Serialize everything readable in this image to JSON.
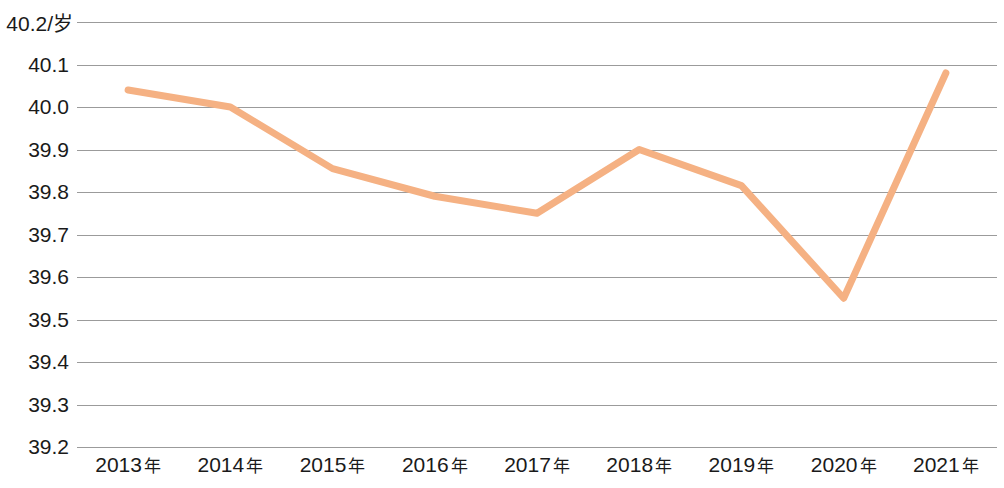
{
  "chart_data": {
    "type": "line",
    "title": "",
    "subtitle": "",
    "xlabel": "",
    "ylabel": "",
    "unit_label": "40.2/岁",
    "unit": "岁",
    "categories": [
      "2013年",
      "2014年",
      "2015年",
      "2016年",
      "2017年",
      "2018年",
      "2019年",
      "2020年",
      "2021年"
    ],
    "x": [
      2013,
      2014,
      2015,
      2016,
      2017,
      2018,
      2019,
      2020,
      2021
    ],
    "values": [
      40.04,
      40.0,
      39.855,
      39.79,
      39.75,
      39.9,
      39.815,
      39.55,
      40.08
    ],
    "series": [
      {
        "name": "",
        "values": [
          40.04,
          40.0,
          39.855,
          39.79,
          39.75,
          39.9,
          39.815,
          39.55,
          40.08
        ]
      }
    ],
    "ylim": [
      39.2,
      40.2
    ],
    "ytick_labels": [
      "40.2/岁",
      "40.1",
      "40.0",
      "39.9",
      "39.8",
      "39.7",
      "39.6",
      "39.5",
      "39.4",
      "39.3",
      "39.2"
    ],
    "yticks": [
      40.2,
      40.1,
      40.0,
      39.9,
      39.8,
      39.7,
      39.6,
      39.5,
      39.4,
      39.3,
      39.2
    ],
    "grid": true,
    "legend": "none",
    "line_color": "#F5B183",
    "grid_color": "#9B9B9B",
    "background_color": "#FFFFFF",
    "text_color": "#1A1A1A"
  }
}
